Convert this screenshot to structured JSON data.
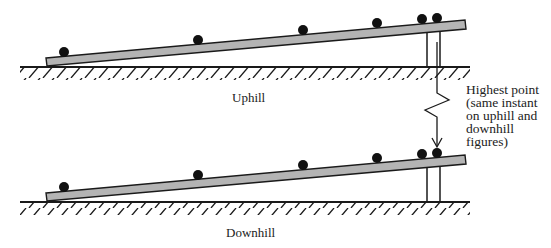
{
  "figure": {
    "labels": {
      "uphill": "Uphill",
      "downhill": "Downhill"
    },
    "annotation": {
      "lines": [
        "Highest point",
        "(same instant",
        "on uphill and",
        "downhill",
        "figures)"
      ]
    },
    "colors": {
      "beam_fill": "#b4b4b4",
      "line": "#1a1a1a",
      "ball": "#111111"
    },
    "panels": [
      {
        "name": "uphill",
        "ground_y": 67,
        "ball_count": 6,
        "balls_x": [
          63,
          198,
          303,
          378,
          422,
          437
        ]
      },
      {
        "name": "downhill",
        "ground_y": 202,
        "ball_count": 6,
        "balls_x": [
          63,
          198,
          303,
          378,
          422,
          437
        ]
      }
    ]
  }
}
